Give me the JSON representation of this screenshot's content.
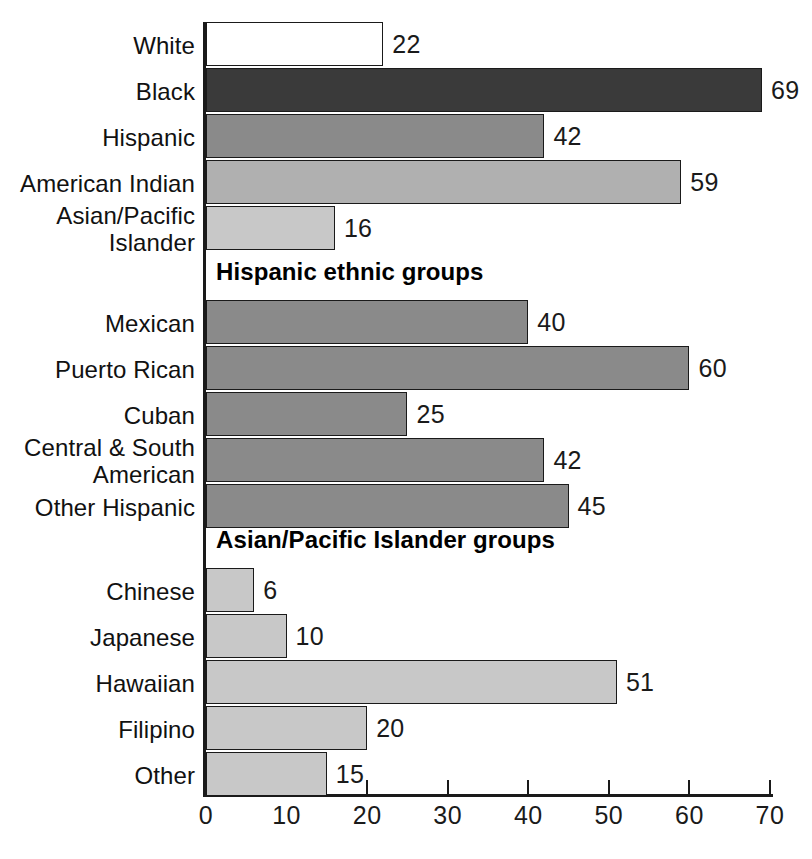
{
  "chart_data": {
    "type": "bar",
    "orientation": "horizontal",
    "title": "",
    "xlabel": "",
    "ylabel": "",
    "xlim": [
      0,
      70
    ],
    "xticks": [
      0,
      10,
      20,
      30,
      40,
      50,
      60,
      70
    ],
    "xtick_labels": [
      "0",
      "10",
      "20",
      "30",
      "40",
      "50",
      "60",
      "70"
    ],
    "grid": false,
    "legend": "none",
    "sections": [
      {
        "header": "",
        "items": [
          {
            "label": "White",
            "value": 22,
            "value_label": "22",
            "color": "#ffffff"
          },
          {
            "label": "Black",
            "value": 69,
            "value_label": "69",
            "color": "#3a3a3a"
          },
          {
            "label": "Hispanic",
            "value": 42,
            "value_label": "42",
            "color": "#8a8a8a"
          },
          {
            "label": "American Indian",
            "value": 59,
            "value_label": "59",
            "color": "#b0b0b0"
          },
          {
            "label": "Asian/Pacific\nIslander",
            "value": 16,
            "value_label": "16",
            "color": "#c8c8c8"
          }
        ]
      },
      {
        "header": "Hispanic ethnic groups",
        "items": [
          {
            "label": "Mexican",
            "value": 40,
            "value_label": "40",
            "color": "#8a8a8a"
          },
          {
            "label": "Puerto Rican",
            "value": 60,
            "value_label": "60",
            "color": "#8a8a8a"
          },
          {
            "label": "Cuban",
            "value": 25,
            "value_label": "25",
            "color": "#8a8a8a"
          },
          {
            "label": "Central & South\nAmerican",
            "value": 42,
            "value_label": "42",
            "color": "#8a8a8a"
          },
          {
            "label": "Other Hispanic",
            "value": 45,
            "value_label": "45",
            "color": "#8a8a8a"
          }
        ]
      },
      {
        "header": "Asian/Pacific Islander groups",
        "items": [
          {
            "label": "Chinese",
            "value": 6,
            "value_label": "6",
            "color": "#c8c8c8"
          },
          {
            "label": "Japanese",
            "value": 10,
            "value_label": "10",
            "color": "#c8c8c8"
          },
          {
            "label": "Hawaiian",
            "value": 51,
            "value_label": "51",
            "color": "#c8c8c8"
          },
          {
            "label": "Filipino",
            "value": 20,
            "value_label": "20",
            "color": "#c8c8c8"
          },
          {
            "label": "Other",
            "value": 15,
            "value_label": "15",
            "color": "#c8c8c8"
          }
        ]
      }
    ]
  },
  "axis": {
    "line_color": "#1a1a1a"
  }
}
